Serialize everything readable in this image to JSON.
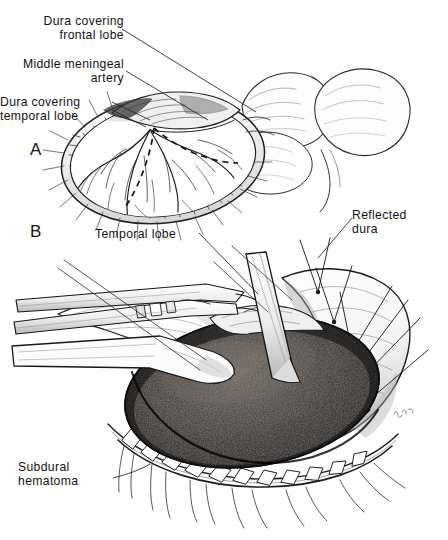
{
  "figure": {
    "background_color": "#ffffff",
    "ink_color": "#111111",
    "hematoma_color": "#2b2724",
    "top_crop_fragment": "   .     .                    .   "
  },
  "panels": [
    {
      "letter": "A",
      "name": "panel-a",
      "caption": "Craniotomy flap turned down; dura intact with middle meningeal artery branches and dashed dural incision lines"
    },
    {
      "letter": "B",
      "name": "panel-b",
      "caption": "Dura reflected with stay sutures; dark subdural hematoma exposed over the temporal lobe"
    }
  ],
  "labels": {
    "dura_frontal": "Dura covering\nfrontal lobe",
    "middle_meningeal_artery": "Middle meningeal\nartery",
    "dura_temporal": "Dura covering\ntemporal lobe",
    "temporal_lobe": "Temporal lobe",
    "reflected_dura": "Reflected\ndura",
    "subdural_hematoma": "Subdural\nhematoma"
  },
  "panel_letters": {
    "a": "A",
    "b": "B"
  },
  "structures": {
    "skull_bone_edge": "bone-edge",
    "scalp_clips": "scalp-clip",
    "stay_sutures": "stay-suture",
    "forceps": "forceps-instrument",
    "retractor": "brain-retractor",
    "brain_surface": "cortical-surface",
    "signature": "artist-signature"
  }
}
